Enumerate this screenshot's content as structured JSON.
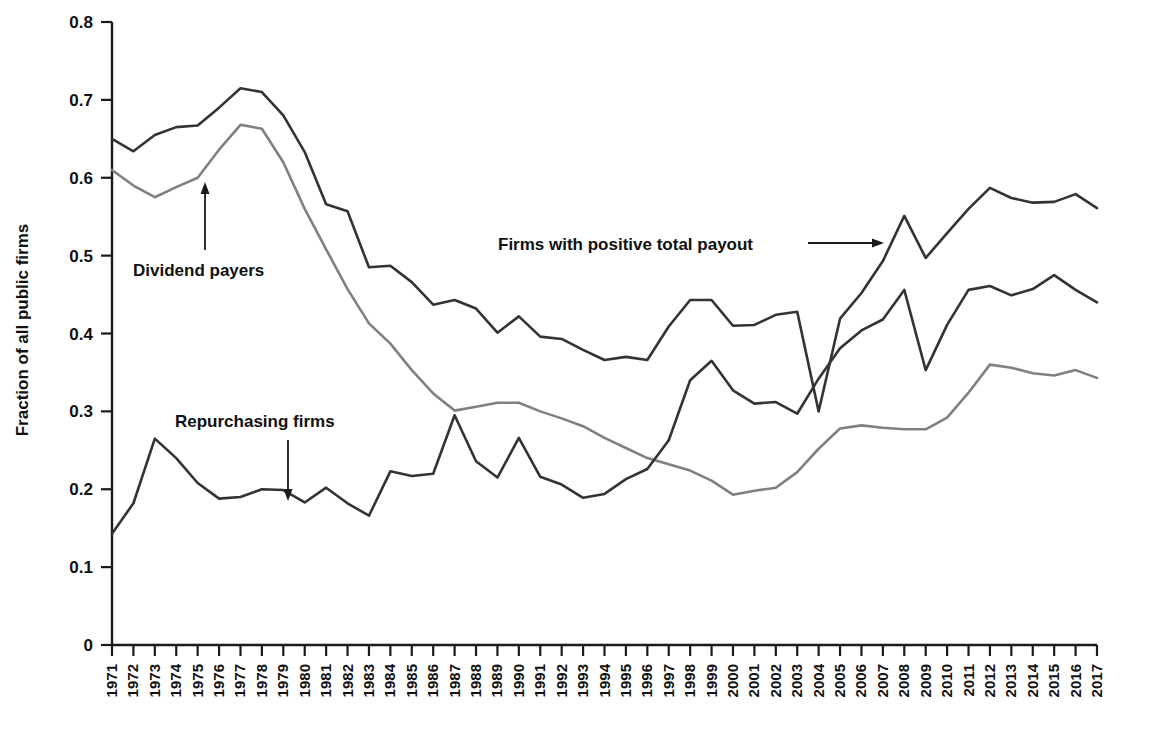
{
  "chart_data": {
    "type": "line",
    "title": "",
    "xlabel": "",
    "ylabel": "Fraction of all public firms",
    "ylim": [
      0,
      0.8
    ],
    "ytick_labels": [
      "0",
      "0.1",
      "0.2",
      "0.3",
      "0.4",
      "0.5",
      "0.6",
      "0.7",
      "0.8"
    ],
    "ytick_values": [
      0,
      0.1,
      0.2,
      0.3,
      0.4,
      0.5,
      0.6,
      0.7,
      0.8
    ],
    "grid": false,
    "legend": "inline annotations with arrows",
    "categories": [
      "1971",
      "1972",
      "1973",
      "1974",
      "1975",
      "1976",
      "1977",
      "1978",
      "1979",
      "1980",
      "1981",
      "1982",
      "1983",
      "1984",
      "1985",
      "1986",
      "1987",
      "1988",
      "1989",
      "1990",
      "1991",
      "1992",
      "1993",
      "1994",
      "1995",
      "1996",
      "1997",
      "1998",
      "1999",
      "2000",
      "2001",
      "2002",
      "2003",
      "2004",
      "2005",
      "2006",
      "2007",
      "2008",
      "2009",
      "2010",
      "2011",
      "2012",
      "2013",
      "2014",
      "2015",
      "2016",
      "2017"
    ],
    "series": [
      {
        "name": "Firms with positive total payout",
        "color": "#333333",
        "values": [
          0.65,
          0.634,
          0.655,
          0.665,
          0.667,
          0.69,
          0.715,
          0.71,
          0.68,
          0.633,
          0.566,
          0.557,
          0.485,
          0.487,
          0.466,
          0.437,
          0.443,
          0.432,
          0.401,
          0.422,
          0.396,
          0.393,
          0.379,
          0.366,
          0.37,
          0.366,
          0.409,
          0.443,
          0.443,
          0.41,
          0.411,
          0.424,
          0.428,
          0.3,
          0.419,
          0.452,
          0.493,
          0.551,
          0.497,
          0.529,
          0.56,
          0.587,
          0.574,
          0.568,
          0.569,
          0.579,
          0.561
        ]
      },
      {
        "name": "Dividend payers",
        "color": "#808080",
        "values": [
          0.61,
          0.59,
          0.575,
          0.588,
          0.6,
          0.636,
          0.668,
          0.663,
          0.62,
          0.56,
          0.508,
          0.457,
          0.413,
          0.387,
          0.353,
          0.323,
          0.301,
          0.306,
          0.311,
          0.311,
          0.3,
          0.291,
          0.281,
          0.266,
          0.253,
          0.24,
          0.232,
          0.224,
          0.211,
          0.193,
          0.198,
          0.202,
          0.222,
          0.252,
          0.278,
          0.282,
          0.279,
          0.277,
          0.277,
          0.292,
          0.324,
          0.36,
          0.356,
          0.349,
          0.346,
          0.353,
          0.343
        ]
      },
      {
        "name": "Repurchasing firms",
        "color": "#333333",
        "values": [
          0.143,
          0.182,
          0.265,
          0.24,
          0.208,
          0.188,
          0.19,
          0.2,
          0.199,
          0.183,
          0.202,
          0.182,
          0.166,
          0.223,
          0.217,
          0.22,
          0.295,
          0.236,
          0.215,
          0.266,
          0.216,
          0.206,
          0.189,
          0.194,
          0.213,
          0.226,
          0.263,
          0.34,
          0.365,
          0.327,
          0.31,
          0.312,
          0.297,
          0.342,
          0.381,
          0.404,
          0.418,
          0.456,
          0.353,
          0.411,
          0.456,
          0.461,
          0.449,
          0.457,
          0.475,
          0.456,
          0.44
        ]
      }
    ],
    "annotations": [
      {
        "id": "dividend-payers",
        "text": "Dividend payers",
        "arrow": "up"
      },
      {
        "id": "repurchasing-firms",
        "text": "Repurchasing firms",
        "arrow": "down"
      },
      {
        "id": "positive-total-payout",
        "text": "Firms with positive total payout",
        "arrow": "right"
      }
    ]
  }
}
